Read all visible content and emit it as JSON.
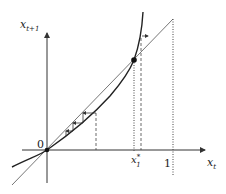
{
  "figure": {
    "type": "cobweb diagram",
    "y_axis_label": "x",
    "y_axis_subscript": "t+1",
    "x_axis_label": "x",
    "x_axis_subscript": "t",
    "origin_label": "0",
    "fixed_point_label": "x",
    "fixed_point_sub": "1",
    "fixed_point_sup": "*",
    "one_label": "1",
    "colors": {
      "axis": "#333333",
      "curve": "#222222",
      "diagonal": "#555555",
      "guide": "#444444"
    }
  }
}
